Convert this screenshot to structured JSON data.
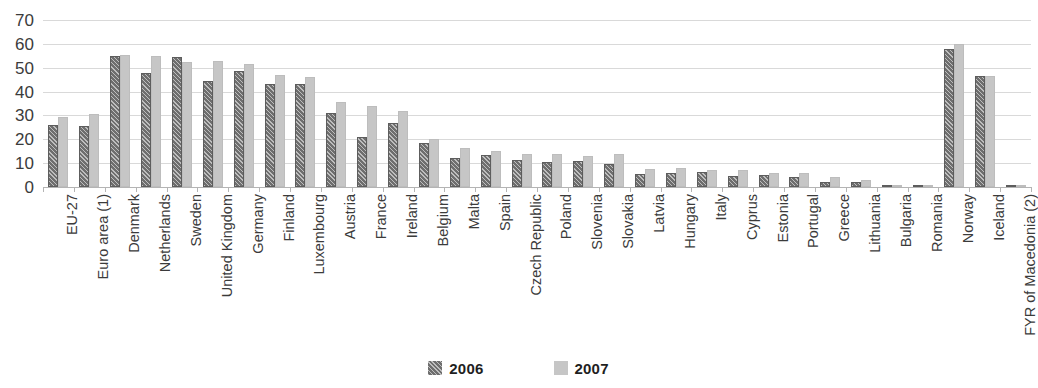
{
  "chart_data": {
    "type": "bar",
    "title": "",
    "subtitle": "",
    "xlabel": "",
    "ylabel": "",
    "ylim": [
      0,
      70
    ],
    "yticks": [
      0,
      10,
      20,
      30,
      40,
      50,
      60,
      70
    ],
    "ytick_labels": [
      "0",
      "10",
      "20",
      "30",
      "40",
      "50",
      "60",
      "70"
    ],
    "grid": true,
    "legend_position": "bottom",
    "categories": [
      "EU-27",
      "Euro area (1)",
      "Denmark",
      "Netherlands",
      "Sweden",
      "United Kingdom",
      "Germany",
      "Finland",
      "Luxembourg",
      "Austria",
      "France",
      "Ireland",
      "Belgium",
      "Malta",
      "Spain",
      "Czech Republic",
      "Poland",
      "Slovenia",
      "Slovakia",
      "Latvia",
      "Hungary",
      "Italy",
      "Cyprus",
      "Estonia",
      "Portugal",
      "Greece",
      "Lithuania",
      "Bulgaria",
      "Romania",
      "Norway",
      "Iceland",
      "FYR of Macedonia (2)"
    ],
    "series": [
      {
        "name": "2006",
        "color": "#6e6e6e",
        "pattern": "diagonal-hatch",
        "values": [
          26,
          25.5,
          55,
          48,
          54.5,
          44.5,
          48.5,
          43,
          43,
          31,
          21,
          27,
          18.5,
          12,
          13.5,
          11.5,
          10.5,
          11,
          9.5,
          5.5,
          6,
          6.5,
          4.5,
          5,
          4,
          2,
          2,
          0.5,
          0.2,
          58,
          46.5,
          0
        ]
      },
      {
        "name": "2007",
        "color": "#c6c6c6",
        "pattern": "solid",
        "values": [
          29.5,
          30.5,
          55.5,
          55,
          52.5,
          53,
          51.5,
          47,
          46,
          35.5,
          34,
          32,
          20,
          16.5,
          15,
          14,
          14,
          13,
          14,
          7.5,
          8,
          7,
          7,
          6,
          6,
          4,
          3,
          1,
          1,
          60,
          46.5,
          0.5
        ]
      }
    ]
  },
  "legend": {
    "items": [
      {
        "label": "2006",
        "swatch_class": "s2006"
      },
      {
        "label": "2007",
        "swatch_class": "s2007"
      }
    ]
  }
}
